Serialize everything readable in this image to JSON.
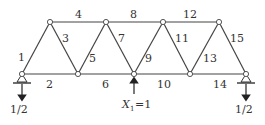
{
  "diagram": {
    "type": "truss",
    "nodes": {
      "bottom": [
        [
          22,
          74
        ],
        [
          78,
          74
        ],
        [
          134,
          74
        ],
        [
          190,
          74
        ],
        [
          246,
          74
        ]
      ],
      "top": [
        [
          50,
          22
        ],
        [
          106,
          22
        ],
        [
          163,
          22
        ],
        [
          219,
          22
        ]
      ]
    },
    "member_labels": {
      "m1": "1",
      "m2": "2",
      "m3": "3",
      "m4": "4",
      "m5": "5",
      "m6": "6",
      "m7": "7",
      "m8": "8",
      "m9": "9",
      "m10": "10",
      "m11": "11",
      "m12": "12",
      "m13": "13",
      "m14": "14",
      "m15": "15"
    },
    "left_reaction": "1/2",
    "right_reaction": "1/2",
    "applied_force": {
      "symbol": "X",
      "subscript": "1",
      "value": "=1"
    }
  }
}
